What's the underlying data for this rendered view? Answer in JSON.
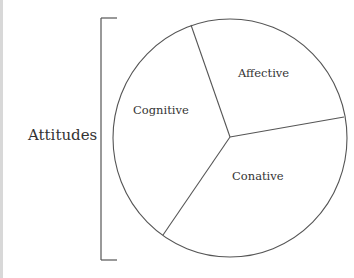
{
  "diagram": {
    "group_label": "Attitudes",
    "segments": [
      {
        "label": "Affective"
      },
      {
        "label": "Cognitive"
      },
      {
        "label": "Conative"
      }
    ]
  },
  "colors": {
    "stroke": "#555555",
    "text": "#333333",
    "background": "#ffffff"
  }
}
